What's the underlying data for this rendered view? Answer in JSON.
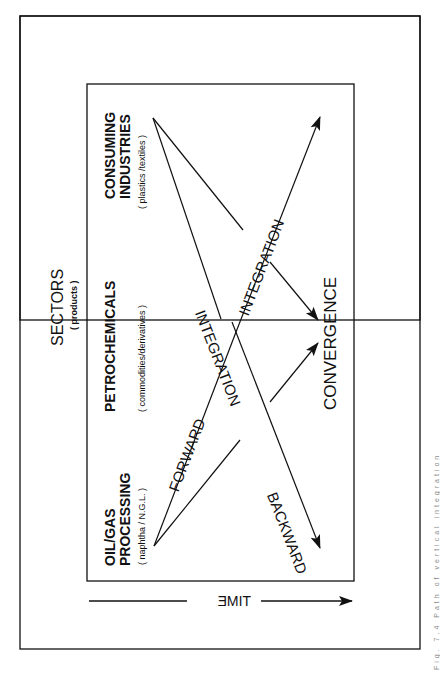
{
  "figure": {
    "colors": {
      "ink": "#111111",
      "background": "#ffffff",
      "caption": "#888888"
    },
    "header": {
      "title": "SECTORS",
      "subtitle": "( products )"
    },
    "sectors": [
      {
        "name": "OIL/GAS",
        "name2": "PROCESSING",
        "products": "( naphtha / N.G.L. )"
      },
      {
        "name": "PETROCHEMICALS",
        "products": "( commodities/derivatives )"
      },
      {
        "name": "CONSUMING",
        "name2": "INDUSTRIES",
        "products": "( plastics /textiles )"
      }
    ],
    "flows": {
      "forward": "FORWARD",
      "backward": "BACKWARD",
      "integration_upper": "INTEGRATION",
      "integration_lower": "INTEGRATION",
      "convergence": "CONVERGENCE"
    },
    "axis": {
      "label": "TIME",
      "direction": "right"
    },
    "caption": "Fig. 7.4  Path of vertical integration"
  }
}
